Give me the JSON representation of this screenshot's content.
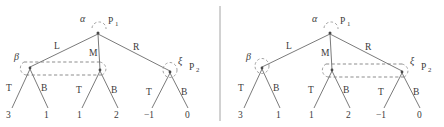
{
  "figure": {
    "type": "game-tree-pair",
    "divider_x": 220,
    "panels": [
      {
        "id": "left-panel",
        "name": "left-game-tree",
        "root": {
          "label_greek": "α",
          "player": "P",
          "player_sub": "1",
          "x": 98,
          "y": 32
        },
        "root_actions": [
          {
            "label": "L",
            "x": 58,
            "y": 49
          },
          {
            "label": "M",
            "x": 93,
            "y": 53
          },
          {
            "label": "R",
            "x": 135,
            "y": 50
          }
        ],
        "decision_nodes": [
          {
            "id": "left-node",
            "label_greek": "β",
            "x": 30,
            "y": 68
          },
          {
            "id": "middle-node",
            "label_greek": "",
            "x": 100,
            "y": 70
          },
          {
            "id": "right-node",
            "label_greek": "ξ",
            "x": 170,
            "y": 72
          }
        ],
        "greek_labels": [
          {
            "text": "β",
            "x": 14,
            "y": 60
          },
          {
            "text": "ξ",
            "x": 180,
            "y": 64
          }
        ],
        "player_labels": [
          {
            "text": "P",
            "sub": "1",
            "x": 108,
            "y": 25
          },
          {
            "text": "P",
            "sub": "2",
            "x": 190,
            "y": 70
          }
        ],
        "leaf_actions": [
          {
            "label": "T",
            "x": 9,
            "y": 88
          },
          {
            "label": "B",
            "x": 44,
            "y": 88
          },
          {
            "label": "T",
            "x": 79,
            "y": 90
          },
          {
            "label": "B",
            "x": 114,
            "y": 90
          },
          {
            "label": "T",
            "x": 149,
            "y": 92
          },
          {
            "label": "B",
            "x": 184,
            "y": 92
          }
        ],
        "payoffs": [
          {
            "value": "3",
            "x": 9,
            "y": 114
          },
          {
            "value": "1",
            "x": 46,
            "y": 114
          },
          {
            "value": "1",
            "x": 79,
            "y": 114
          },
          {
            "value": "2",
            "x": 116,
            "y": 114
          },
          {
            "value": "−1",
            "x": 147,
            "y": 114
          },
          {
            "value": "0",
            "x": 187,
            "y": 114
          }
        ],
        "information_set": {
          "connects": [
            "left-node",
            "middle-node"
          ],
          "style": "double-dashed-loop"
        },
        "singleton_set": {
          "at": "right-node",
          "style": "dashed-oval"
        }
      },
      {
        "id": "right-panel",
        "name": "right-game-tree",
        "root": {
          "label_greek": "α",
          "player": "P",
          "player_sub": "1",
          "x": 330,
          "y": 32
        },
        "root_actions": [
          {
            "label": "L",
            "x": 290,
            "y": 49
          },
          {
            "label": "M",
            "x": 325,
            "y": 53
          },
          {
            "label": "R",
            "x": 367,
            "y": 50
          }
        ],
        "decision_nodes": [
          {
            "id": "left-node",
            "label_greek": "β",
            "x": 262,
            "y": 68
          },
          {
            "id": "middle-node",
            "label_greek": "",
            "x": 332,
            "y": 70
          },
          {
            "id": "right-node",
            "label_greek": "ξ",
            "x": 402,
            "y": 72
          }
        ],
        "greek_labels": [
          {
            "text": "β",
            "x": 246,
            "y": 60
          },
          {
            "text": "ξ",
            "x": 412,
            "y": 64
          }
        ],
        "player_labels": [
          {
            "text": "P",
            "sub": "1",
            "x": 340,
            "y": 25
          },
          {
            "text": "P",
            "sub": "2",
            "x": 422,
            "y": 70
          }
        ],
        "leaf_actions": [
          {
            "label": "T",
            "x": 241,
            "y": 88
          },
          {
            "label": "B",
            "x": 276,
            "y": 88
          },
          {
            "label": "T",
            "x": 311,
            "y": 90
          },
          {
            "label": "B",
            "x": 346,
            "y": 90
          },
          {
            "label": "T",
            "x": 381,
            "y": 92
          },
          {
            "label": "B",
            "x": 416,
            "y": 92
          }
        ],
        "payoffs": [
          {
            "value": "3",
            "x": 241,
            "y": 114
          },
          {
            "value": "1",
            "x": 278,
            "y": 114
          },
          {
            "value": "1",
            "x": 311,
            "y": 114
          },
          {
            "value": "2",
            "x": 348,
            "y": 114
          },
          {
            "value": "−1",
            "x": 379,
            "y": 114
          },
          {
            "value": "0",
            "x": 419,
            "y": 114
          }
        ],
        "information_set": {
          "connects": [
            "middle-node",
            "right-node"
          ],
          "style": "double-dashed-loop"
        },
        "singleton_set": {
          "at": "left-node",
          "style": "dashed-oval"
        }
      }
    ],
    "colors": {
      "ink": "#3a3a3a",
      "edge": "#6b6b6b",
      "dashed": "#7a7a7a",
      "divider": "#9a9a9a",
      "background": "#ffffff"
    }
  }
}
